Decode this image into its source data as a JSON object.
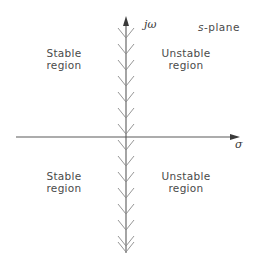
{
  "diagram": {
    "plane_label": {
      "variable": "s",
      "rest": "-plane"
    },
    "axes": {
      "vertical_label": "jω",
      "horizontal_label": "σ",
      "colors": {
        "axis": "#555555",
        "hatch": "#888888"
      }
    },
    "regions": {
      "top_left": {
        "line1": "Stable",
        "line2": "region"
      },
      "top_right": {
        "line1": "Unstable",
        "line2": "region"
      },
      "bottom_left": {
        "line1": "Stable",
        "line2": "region"
      },
      "bottom_right": {
        "line1": "Unstable",
        "line2": "region"
      }
    }
  }
}
